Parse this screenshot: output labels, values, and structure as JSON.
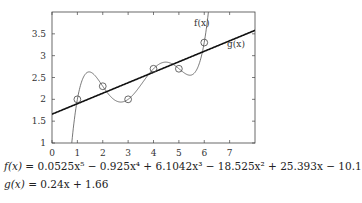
{
  "chart_data": {
    "type": "line",
    "title": "",
    "xlabel": "",
    "ylabel": "",
    "xlim": [
      0,
      8
    ],
    "ylim": [
      1,
      4
    ],
    "x_ticks": [
      0,
      1,
      2,
      3,
      4,
      5,
      6,
      7
    ],
    "y_ticks": [
      1,
      1.5,
      2,
      2.5,
      3,
      3.5
    ],
    "x_tick_labels": [
      "0",
      "1",
      "2",
      "3",
      "4",
      "5",
      "6",
      "7"
    ],
    "y_tick_labels": [
      "1",
      "1.5",
      "2",
      "2.5",
      "3",
      "3.5"
    ],
    "grid": false,
    "points": {
      "x": [
        1,
        2,
        3,
        4,
        5,
        6
      ],
      "y": [
        2,
        2.3,
        2,
        2.7,
        2.7,
        3.3
      ],
      "marker": "open-circle"
    },
    "series": [
      {
        "name": "f(x)",
        "label": "f(x)",
        "kind": "polynomial",
        "coefficients_desc": [
          0.0525,
          -0.925,
          6.1042,
          -18.525,
          25.393,
          -10.1
        ],
        "color": "#555555",
        "width": 0.8
      },
      {
        "name": "g(x)",
        "label": "g(x)",
        "kind": "linear",
        "coefficients_desc": [
          0.24,
          1.66
        ],
        "color": "#111111",
        "width": 1.6
      }
    ],
    "annotations": [
      {
        "text": "f(x)",
        "x": 5.6,
        "y": 3.68
      },
      {
        "text": "g(x)",
        "x": 6.9,
        "y": 3.2
      }
    ]
  },
  "formulas": {
    "f_lhs": "f(x)",
    "f_rhs": " = 0.0525x⁵ − 0.925x⁴ + 6.1042x³ − 18.525x² + 25.393x − 10.1",
    "g_lhs": "g(x)",
    "g_rhs": " = 0.24x + 1.66"
  }
}
